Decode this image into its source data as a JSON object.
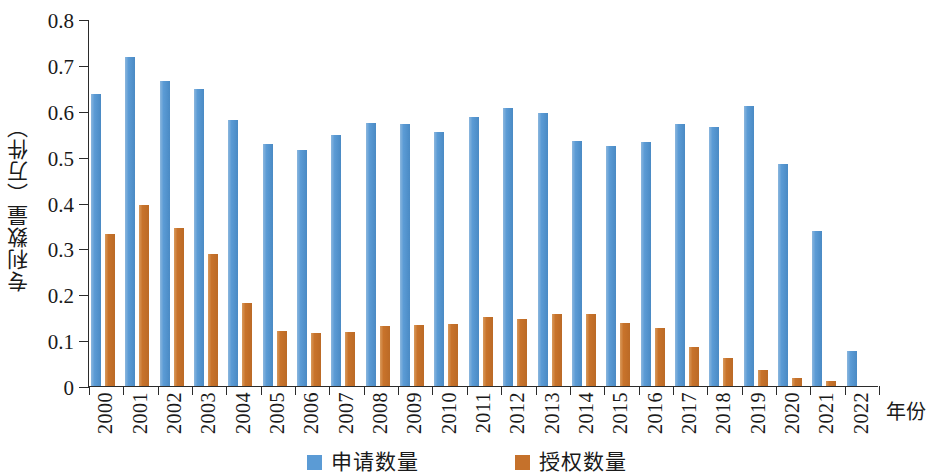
{
  "chart_data": {
    "type": "bar",
    "title": "",
    "xlabel": "年份",
    "ylabel": "专利数量（万件）",
    "ylim": [
      0,
      0.8
    ],
    "ytick_labels": [
      "0.8",
      "0.7",
      "0.6",
      "0.5",
      "0.4",
      "0.3",
      "0.2",
      "0.1",
      "0"
    ],
    "ytick_values": [
      0.8,
      0.7,
      0.6,
      0.5,
      0.4,
      0.3,
      0.2,
      0.1,
      0
    ],
    "grid": false,
    "legend_position": "bottom-center",
    "categories": [
      "2000",
      "2001",
      "2002",
      "2003",
      "2004",
      "2005",
      "2006",
      "2007",
      "2008",
      "2009",
      "2010",
      "2011",
      "2012",
      "2013",
      "2014",
      "2015",
      "2016",
      "2017",
      "2018",
      "2019",
      "2020",
      "2021",
      "2022"
    ],
    "series": [
      {
        "name": "申请数量",
        "color": "#5B9BD5",
        "values": [
          0.637,
          0.717,
          0.665,
          0.647,
          0.58,
          0.528,
          0.515,
          0.548,
          0.573,
          0.571,
          0.554,
          0.587,
          0.606,
          0.596,
          0.535,
          0.523,
          0.532,
          0.571,
          0.565,
          0.61,
          0.483,
          0.337,
          0.077
        ]
      },
      {
        "name": "授权数量",
        "color": "#C5712B",
        "values": [
          0.332,
          0.394,
          0.344,
          0.288,
          0.18,
          0.119,
          0.115,
          0.118,
          0.131,
          0.132,
          0.135,
          0.151,
          0.147,
          0.157,
          0.156,
          0.138,
          0.127,
          0.086,
          0.061,
          0.034,
          0.018,
          0.012,
          0.0
        ]
      }
    ]
  },
  "legend": {
    "items": [
      {
        "label": "申请数量",
        "color": "#5B9BD5"
      },
      {
        "label": "授权数量",
        "color": "#C5712B"
      }
    ]
  },
  "axes": {
    "y_title": "专利数量（万件）",
    "x_title": "年份"
  }
}
